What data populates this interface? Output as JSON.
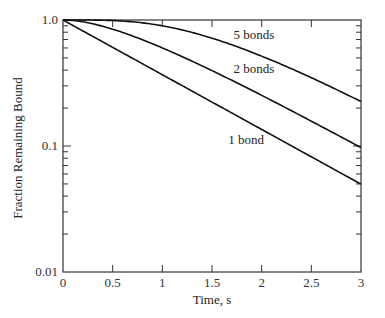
{
  "chart_data": {
    "type": "line",
    "title": "",
    "xlabel": "Time, s",
    "ylabel": "Fraction Remaining Bound",
    "xlim": [
      0,
      3
    ],
    "ylim": [
      0.01,
      1.0
    ],
    "yscale": "log",
    "grid": false,
    "legend": "inline labels",
    "x_ticks": [
      "0",
      "0.5",
      "1",
      "1.5",
      "2",
      "2.5",
      "3"
    ],
    "y_ticks": [
      "0.01",
      "0.1",
      "1.0"
    ],
    "x": [
      0,
      0.25,
      0.5,
      0.75,
      1.0,
      1.25,
      1.5,
      1.75,
      2.0,
      2.25,
      2.5,
      2.75,
      3.0
    ],
    "series": [
      {
        "name": "1 bond",
        "values": [
          1.0,
          0.779,
          0.607,
          0.472,
          0.368,
          0.287,
          0.223,
          0.174,
          0.135,
          0.105,
          0.082,
          0.064,
          0.05
        ]
      },
      {
        "name": "2 bonds",
        "values": [
          1.0,
          0.951,
          0.845,
          0.719,
          0.6,
          0.491,
          0.397,
          0.317,
          0.252,
          0.2,
          0.158,
          0.124,
          0.097
        ]
      },
      {
        "name": "5 bonds",
        "values": [
          1.0,
          0.999,
          0.99,
          0.962,
          0.901,
          0.817,
          0.717,
          0.615,
          0.518,
          0.428,
          0.35,
          0.283,
          0.225
        ]
      }
    ],
    "annotations": [
      {
        "text": "5 bonds",
        "x": 1.65,
        "y": 0.82
      },
      {
        "text": "2 bonds",
        "x": 1.65,
        "y": 0.45
      },
      {
        "text": "1 bond",
        "x": 1.6,
        "y": 0.12
      }
    ]
  }
}
